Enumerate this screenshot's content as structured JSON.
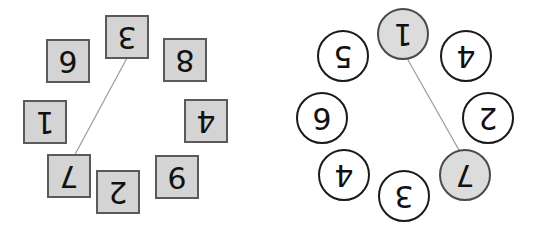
{
  "figure": {
    "title": "",
    "background_color": "#ffffff",
    "panel_count": 2,
    "global_rotation_degrees": 180,
    "note": "All node labels are rendered rotated 180 degrees."
  },
  "colors": {
    "square_fill": "#d4d4d4",
    "square_stroke": "#5a5a5a",
    "circle_fill": "#ffffff",
    "circle_fill_shaded": "#dcdcdc",
    "circle_stroke": "#1a1a1a",
    "circle_stroke_shaded": "#4a4a4a",
    "edge_stroke": "#9a9a9a",
    "glyph_color": "#111111",
    "background": "#ffffff"
  },
  "left_panel": {
    "name": "square-node-ring",
    "shape": "square",
    "node_count": 8,
    "nodes": [
      {
        "id": "L1",
        "label": "3",
        "x": 127,
        "y": 37,
        "shaded": true,
        "role": "edge-endpoint"
      },
      {
        "id": "L2",
        "label": "8",
        "x": 185,
        "y": 60,
        "shaded": true,
        "role": "ring-node"
      },
      {
        "id": "L3",
        "label": "4",
        "x": 206,
        "y": 121,
        "shaded": true,
        "role": "ring-node"
      },
      {
        "id": "L4",
        "label": "9",
        "x": 177,
        "y": 177,
        "shaded": true,
        "role": "ring-node"
      },
      {
        "id": "L5",
        "label": "2",
        "x": 118,
        "y": 192,
        "shaded": true,
        "role": "ring-node"
      },
      {
        "id": "L6",
        "label": "7",
        "x": 69,
        "y": 176,
        "shaded": true,
        "role": "edge-endpoint"
      },
      {
        "id": "L7",
        "label": "1",
        "x": 45,
        "y": 122,
        "shaded": true,
        "role": "ring-node"
      },
      {
        "id": "L8",
        "label": "6",
        "x": 68,
        "y": 61,
        "shaded": true,
        "role": "ring-node"
      }
    ],
    "edges": [
      {
        "from": "L1",
        "to": "L6",
        "x1": 127,
        "y1": 58,
        "x2": 72,
        "y2": 160
      }
    ]
  },
  "right_panel": {
    "name": "circle-node-ring",
    "shape": "circle",
    "node_count": 8,
    "nodes": [
      {
        "id": "R1",
        "label": "1",
        "x": 125,
        "y": 34,
        "shaded": true,
        "role": "edge-endpoint"
      },
      {
        "id": "R2",
        "label": "4",
        "x": 188,
        "y": 56,
        "shaded": false,
        "role": "ring-node"
      },
      {
        "id": "R3",
        "label": "2",
        "x": 210,
        "y": 118,
        "shaded": false,
        "role": "ring-node"
      },
      {
        "id": "R4",
        "label": "7",
        "x": 187,
        "y": 175,
        "shaded": true,
        "role": "edge-endpoint"
      },
      {
        "id": "R5",
        "label": "3",
        "x": 126,
        "y": 196,
        "shaded": false,
        "role": "ring-node"
      },
      {
        "id": "R6",
        "label": "4",
        "x": 66,
        "y": 175,
        "shaded": false,
        "role": "ring-node"
      },
      {
        "id": "R7",
        "label": "6",
        "x": 44,
        "y": 118,
        "shaded": false,
        "role": "ring-node"
      },
      {
        "id": "R8",
        "label": "5",
        "x": 65,
        "y": 56,
        "shaded": false,
        "role": "ring-node"
      }
    ],
    "edges": [
      {
        "from": "R1",
        "to": "R4",
        "x1": 130,
        "y1": 60,
        "x2": 190,
        "y2": 166
      }
    ]
  }
}
